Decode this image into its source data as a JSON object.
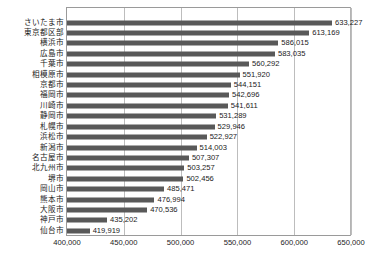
{
  "chart_data": {
    "type": "bar",
    "orientation": "horizontal",
    "title": "",
    "subtitle": "",
    "xlabel": "",
    "ylabel": "",
    "xlim": [
      400000,
      650000
    ],
    "grid": true,
    "legend": null,
    "xticks": [
      "400,000",
      "450,000",
      "500,000",
      "550,000",
      "600,000",
      "650,000"
    ],
    "xtick_values": [
      400000,
      450000,
      500000,
      550000,
      600000,
      650000
    ],
    "categories": [
      "さいたま市",
      "東京都区部",
      "横浜市",
      "広島市",
      "千葉市",
      "相模原市",
      "京都市",
      "福岡市",
      "川崎市",
      "静岡市",
      "札幌市",
      "浜松市",
      "新潟市",
      "名古屋市",
      "北九州市",
      "堺市",
      "岡山市",
      "熊本市",
      "大阪市",
      "神戸市",
      "仙台市"
    ],
    "values": [
      633227,
      613169,
      586015,
      583035,
      560292,
      551920,
      544151,
      542696,
      541611,
      531289,
      529946,
      522927,
      514003,
      507307,
      503257,
      502456,
      485471,
      476994,
      470536,
      435202,
      419919
    ],
    "value_labels": [
      "633,227",
      "613,169",
      "586,015",
      "583,035",
      "560,292",
      "551,920",
      "544,151",
      "542,696",
      "541,611",
      "531,289",
      "529,946",
      "522,927",
      "514,003",
      "507,307",
      "503,257",
      "502,456",
      "485,471",
      "476,994",
      "470,536",
      "435,202",
      "419,919"
    ],
    "colors": {
      "bar": "#595959",
      "grid": "#bdbdbd",
      "axis": "#9a9a9a",
      "text": "#1a1a1a",
      "background": "#ffffff"
    }
  }
}
